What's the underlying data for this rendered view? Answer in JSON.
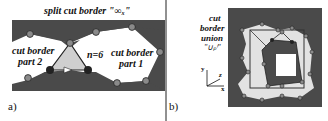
{
  "panel_a": {
    "caption": "a)",
    "title": "split cut border \"∞ₓ\"",
    "label_part2_line1": "cut border",
    "label_part2_line2": "part 2",
    "label_part1_line1": "cut border",
    "label_part1_line2": "part 1",
    "n_label": "n=6",
    "nodes": [
      {
        "id": "1",
        "x": 85,
        "y": 79
      },
      {
        "id": "2",
        "x": 146,
        "y": 81
      },
      {
        "id": "3",
        "x": 117,
        "y": 83
      },
      {
        "id": "4",
        "x": 132,
        "y": 27
      },
      {
        "id": "5",
        "x": 160,
        "y": 52
      },
      {
        "id": "6",
        "x": 96,
        "y": 32
      },
      {
        "id": "7",
        "x": 70,
        "y": 43
      },
      {
        "id": "8",
        "x": 32,
        "y": 34
      },
      {
        "id": "9",
        "x": 30,
        "y": 78
      }
    ]
  },
  "panel_b": {
    "caption": "b)",
    "label_line1": "cut",
    "label_line2": "border",
    "label_line3": "union",
    "label_line4": "\"∪ₚⁱ\"",
    "axes": {
      "x": "x",
      "y": "y",
      "z": "z"
    }
  },
  "colors": {
    "dark_fill": "#4a4a4a",
    "light_fill": "#e2e2e2",
    "triangle_fill": "#cfcfcf",
    "node_fill": "#8a8a8a",
    "node_dark": "#222222"
  }
}
